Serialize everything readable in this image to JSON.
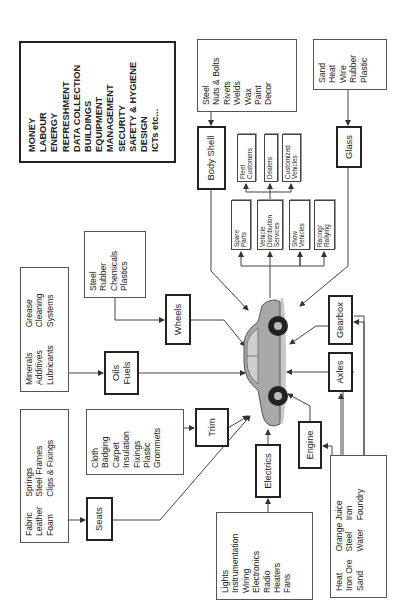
{
  "diagram": {
    "title_hint": "Car manufacturing inputs and outputs",
    "center": {
      "label": "Car",
      "icon": "car-illustration"
    },
    "general_inputs": [
      "MONEY",
      "LABOUR",
      "ENERGY",
      "REFRESHMENT",
      "DATA COLLECTION",
      "BUILDINGS",
      "EQUIPMENT",
      "MANAGEMENT",
      "SECURITY",
      "SAFETY & HYGIENE",
      "DESIGN",
      "ICTs etc..."
    ],
    "components": {
      "body_shell": {
        "label": "Body Shell",
        "inputs": [
          "Steel",
          "Nuts & Bolts",
          "Rivets",
          "Welds",
          "Wax",
          "Paint",
          "Decor"
        ]
      },
      "glass": {
        "label": "Glass",
        "inputs": [
          "Sand",
          "Heat",
          "Wire",
          "Rubber",
          "Plastic"
        ]
      },
      "wheels": {
        "label": "Wheels",
        "inputs": [
          "Steel",
          "Rubber",
          "Chemicals",
          "Plastics"
        ]
      },
      "oils_fuels": {
        "label_lines": [
          "Oils",
          "Fuels"
        ],
        "inputs_col1": [
          "Minerals",
          "Additives",
          "Lubricants"
        ],
        "inputs_col2": [
          "Grease",
          "Cleaning",
          "Systems"
        ]
      },
      "seats": {
        "label": "Seats",
        "inputs_col1": [
          "Fabric",
          "Leather",
          "Foam"
        ],
        "inputs_col2": [
          "Springs",
          "Steel Frames",
          "Clips & Fixings"
        ]
      },
      "trim": {
        "label": "Trim",
        "inputs": [
          "Cloth",
          "Badging",
          "Carpet",
          "Insulation",
          "Fixings",
          "Plastic",
          "Grommets"
        ]
      },
      "electrics": {
        "label": "Electrics",
        "inputs": [
          "Lights",
          "Instrumentation",
          "Wiring",
          "Electronics",
          "Radio",
          "Heaters",
          "Fans"
        ]
      },
      "engine": {
        "label": "Engine"
      },
      "axles": {
        "label": "Axles"
      },
      "gearbox": {
        "label": "Gearbox"
      },
      "engine_axles_gearbox_inputs": {
        "col1": [
          "Heat",
          "Iron Ore",
          "Sand"
        ],
        "col2": [
          "Orange Juice",
          "Steel",
          "Water"
        ],
        "col3": [
          "",
          "Iron",
          "Foundry"
        ]
      }
    },
    "outputs": {
      "primary": [
        {
          "lines": [
            "Spare",
            "Parts"
          ]
        },
        {
          "lines": [
            "Vehicle",
            "Distribution",
            "Services"
          ]
        },
        {
          "lines": [
            "Show",
            "Vehicles"
          ]
        },
        {
          "lines": [
            "Racing/",
            "Rallying"
          ]
        }
      ],
      "distribution": [
        {
          "lines": [
            "Fleet",
            "Customers"
          ]
        },
        {
          "lines": [
            "Dealers"
          ]
        },
        {
          "lines": [
            "Customized",
            "Vehicles"
          ]
        }
      ]
    },
    "colors": {
      "line": "#444444",
      "box_border": "#222222",
      "car_body": "#9a9a9a",
      "tyre": "#222222"
    }
  }
}
